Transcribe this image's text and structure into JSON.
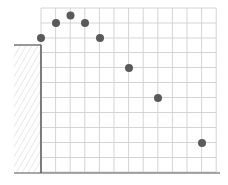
{
  "diagram": {
    "grid": {
      "x_lines": [
        41,
        55.6,
        70.2,
        84.8,
        99.4,
        114,
        128.6,
        143.2,
        157.8,
        172.4,
        187,
        201.6,
        216.2
      ],
      "y_lines": [
        8,
        23,
        38,
        52.5,
        67.5,
        82.5,
        97.5,
        112.5,
        127.5,
        142.5,
        157.5,
        172
      ],
      "color": "#cfcfcf"
    },
    "cliff": {
      "left": 14,
      "right": 41,
      "top": 45,
      "bottom": 173,
      "hatch_color": "#c8c8c8",
      "edge_color": "#444444"
    },
    "ground": {
      "x1": 14,
      "x2": 220,
      "y": 173,
      "color": "#555555"
    },
    "points": [
      {
        "x": 41,
        "y": 38
      },
      {
        "x": 56,
        "y": 23
      },
      {
        "x": 70.5,
        "y": 15.5
      },
      {
        "x": 85,
        "y": 23
      },
      {
        "x": 100,
        "y": 38
      },
      {
        "x": 129,
        "y": 68
      },
      {
        "x": 158,
        "y": 98
      },
      {
        "x": 202,
        "y": 143
      }
    ],
    "point_color": "#5a5a5a",
    "point_radius": 4
  }
}
